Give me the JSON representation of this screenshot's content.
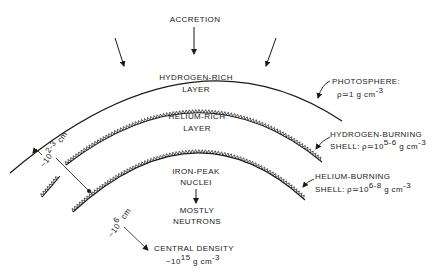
{
  "labels": {
    "accretion": "ACCRETION",
    "hydrogen_rich": [
      "HYDROGEN-RICH",
      "LAYER"
    ],
    "helium_rich": [
      "HELIUM-RICH",
      "LAYER"
    ],
    "iron_peak": [
      "IRON-PEAK",
      "NUCLEI"
    ],
    "mostly_neutrons": [
      "MOSTLY",
      "NEUTRONS"
    ],
    "photosphere": {
      "name": "PHOTOSPHERE:",
      "rho": "ρ",
      "approx": "≃1 g cm",
      "exp": "-3"
    },
    "hydrogen_burning": {
      "name": "HYDROGEN-BURNING",
      "shell": "SHELL:",
      "rho": "ρ",
      "approx": "≃10",
      "exp1": "5-6",
      "unit": " g cm",
      "exp2": "-3"
    },
    "helium_burning": {
      "name": "HELIUM-BURNING",
      "shell": "SHELL:",
      "rho": "ρ",
      "approx": "≃10",
      "exp1": "6-8",
      "unit": " g cm",
      "exp2": "-3"
    },
    "thickness": {
      "prefix": "~10",
      "exp": "2-3",
      "unit": " cm"
    },
    "radius": {
      "prefix": "~10",
      "exp": "6",
      "unit": " cm"
    },
    "central_density": {
      "name": "CENTRAL DENSITY",
      "prefix": "~10",
      "exp": "15",
      "unit": " g cm",
      "exp2": "-3"
    }
  }
}
